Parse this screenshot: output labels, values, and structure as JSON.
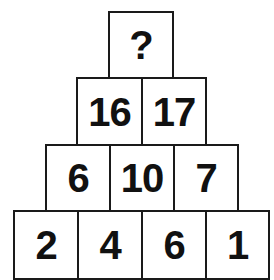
{
  "puzzle": {
    "rows": [
      {
        "cells": [
          {
            "value": "?"
          }
        ]
      },
      {
        "cells": [
          {
            "value": "16"
          },
          {
            "value": "17"
          }
        ]
      },
      {
        "cells": [
          {
            "value": "6"
          },
          {
            "value": "10"
          },
          {
            "value": "7"
          }
        ]
      },
      {
        "cells": [
          {
            "value": "2"
          },
          {
            "value": "4"
          },
          {
            "value": "6"
          },
          {
            "value": "1"
          }
        ]
      }
    ]
  },
  "colors": {
    "border": "#1a1a1a",
    "text": "#111111",
    "background": "#ffffff"
  }
}
